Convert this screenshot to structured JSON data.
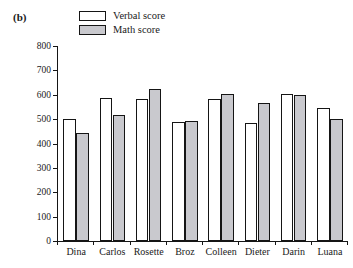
{
  "panel": {
    "label": "(b)"
  },
  "legend": {
    "position": "top-left-inside",
    "entries": [
      {
        "label": "Verbal score",
        "color": "#ffffff",
        "swatch_name": "legend-swatch-verbal"
      },
      {
        "label": "Math score",
        "color": "#c9c9ce",
        "swatch_name": "legend-swatch-math"
      }
    ]
  },
  "chart_data": {
    "type": "bar",
    "title": "",
    "subtitle": "",
    "xlabel": "",
    "ylabel": "",
    "categories": [
      "Dina",
      "Carlos",
      "Rosette",
      "Broz",
      "Colleen",
      "Dieter",
      "Darin",
      "Luana"
    ],
    "series": [
      {
        "name": "Verbal score",
        "color": "#ffffff",
        "values": [
          500,
          586,
          582,
          488,
          583,
          484,
          604,
          547
        ]
      },
      {
        "name": "Math score",
        "color": "#c9c9ce",
        "values": [
          443,
          516,
          623,
          492,
          604,
          566,
          600,
          500
        ]
      }
    ],
    "ylim": [
      0,
      800
    ],
    "ytick_step": 100,
    "yticks": [
      0,
      100,
      200,
      300,
      400,
      500,
      600,
      700,
      800
    ],
    "ytick_labels": [
      "0",
      "100",
      "200",
      "300",
      "400",
      "500",
      "600",
      "700",
      "800"
    ],
    "grid": false,
    "legend_position": "upper left",
    "annotations": [
      "(b)"
    ]
  }
}
